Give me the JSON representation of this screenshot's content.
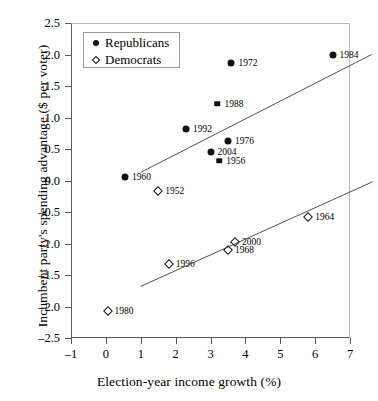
{
  "chart_data": {
    "type": "scatter",
    "title": "",
    "xlabel": "Election-year income growth (%)",
    "ylabel": "Incumbent party's spending advantage ($ per voter)",
    "xlim": [
      -1,
      7
    ],
    "ylim": [
      -2.5,
      2.5
    ],
    "xticks": [
      "-1",
      "0",
      "1",
      "2",
      "3",
      "4",
      "5",
      "6",
      "7"
    ],
    "xtick_values": [
      -1,
      0,
      1,
      2,
      3,
      4,
      5,
      6,
      7
    ],
    "yticks": [
      "2.5",
      "2.0",
      "1.5",
      "1.0",
      "0.5",
      "0.0",
      "-0.5",
      "-1.0",
      "-1.5",
      "-2.0",
      "-2.5"
    ],
    "ytick_values": [
      2.5,
      2.0,
      1.5,
      1.0,
      0.5,
      0.0,
      -0.5,
      -1.0,
      -1.5,
      -2.0,
      -2.5
    ],
    "grid": false,
    "legend_position": "upper-left",
    "series": [
      {
        "name": "Republicans",
        "marker": "filled-circle",
        "color": "#111111",
        "points": [
          {
            "label": "1960",
            "x": 0.55,
            "y": 0.05,
            "label_side": "right",
            "marker_size": "large"
          },
          {
            "label": "1992",
            "x": 2.3,
            "y": 0.82,
            "label_side": "right",
            "marker_size": "large"
          },
          {
            "label": "2004",
            "x": 3.0,
            "y": 0.45,
            "label_side": "right",
            "marker_size": "large"
          },
          {
            "label": "1956",
            "x": 3.25,
            "y": 0.31,
            "label_side": "right",
            "marker_size": "small"
          },
          {
            "label": "1976",
            "x": 3.5,
            "y": 0.62,
            "label_side": "right",
            "marker_size": "large"
          },
          {
            "label": "1988",
            "x": 3.2,
            "y": 1.22,
            "label_side": "right",
            "marker_size": "small"
          },
          {
            "label": "1972",
            "x": 3.6,
            "y": 1.87,
            "label_side": "right",
            "marker_size": "large"
          },
          {
            "label": "1984",
            "x": 6.5,
            "y": 2.0,
            "label_side": "right",
            "marker_size": "large"
          }
        ]
      },
      {
        "name": "Democrats",
        "marker": "open-diamond",
        "color": "#111111",
        "points": [
          {
            "label": "1980",
            "x": 0.05,
            "y": -2.07,
            "label_side": "right",
            "marker_size": "large"
          },
          {
            "label": "1952",
            "x": 1.5,
            "y": -0.17,
            "label_side": "right",
            "marker_size": "large"
          },
          {
            "label": "1996",
            "x": 1.8,
            "y": -1.33,
            "label_side": "right",
            "marker_size": "large"
          },
          {
            "label": "1968",
            "x": 3.5,
            "y": -1.11,
            "label_side": "right",
            "marker_size": "large"
          },
          {
            "label": "2000",
            "x": 3.7,
            "y": -0.97,
            "label_side": "right",
            "marker_size": "large"
          },
          {
            "label": "1964",
            "x": 5.8,
            "y": -0.58,
            "label_side": "right",
            "marker_size": "large"
          }
        ]
      }
    ],
    "trendlines": [
      {
        "name": "republicans-fit",
        "x0": 1.0,
        "y0": 0.13,
        "x1": 7.62,
        "y1": 2.0
      },
      {
        "name": "democrats-fit",
        "x0": 1.0,
        "y0": -1.68,
        "x1": 7.65,
        "y1": -0.02
      }
    ]
  },
  "legend": {
    "items": [
      {
        "label": "Republicans",
        "marker": "filled-circle"
      },
      {
        "label": "Democrats",
        "marker": "open-diamond"
      }
    ]
  }
}
